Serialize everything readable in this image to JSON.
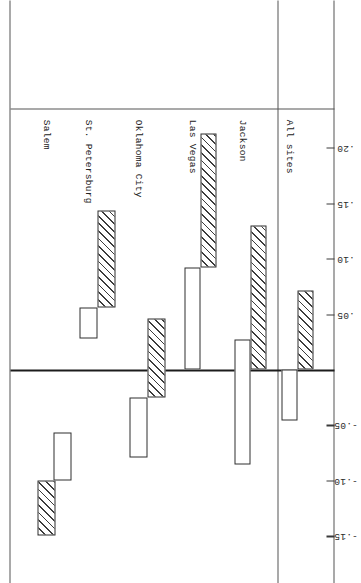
{
  "chart_data": {
    "type": "bar",
    "title": "",
    "subtitle": "",
    "xlabel": "",
    "ylabel": "",
    "orientation": "rotated-90",
    "grid": false,
    "legend_position": "none",
    "categories": [
      "All sites",
      "Jackson",
      "Las Vegas",
      "Oklahoma City",
      "St. Petersburg",
      "Salem"
    ],
    "value_axis": {
      "ticks": [
        0.2,
        0.15,
        0.1,
        0.05,
        0.0,
        -0.05,
        -0.1,
        -0.15
      ],
      "tick_labels": [
        ".20",
        ".15",
        ".10",
        ".05",
        "0",
        "-.05",
        "-.10",
        "-.15"
      ],
      "ylim": [
        -0.18,
        0.23
      ],
      "zero_reference": 0.0
    },
    "series": [
      {
        "name": "hatched",
        "style": "hatched",
        "bars": [
          {
            "category": "All sites",
            "start": 0.0,
            "end": 0.071
          },
          {
            "category": "Jackson",
            "start": 0.0,
            "end": 0.13
          },
          {
            "category": "Las Vegas",
            "start": 0.092,
            "end": 0.213
          },
          {
            "category": "Oklahoma City",
            "start": -0.025,
            "end": 0.046
          },
          {
            "category": "St. Petersburg",
            "start": 0.056,
            "end": 0.143
          },
          {
            "category": "Salem",
            "start": -0.15,
            "end": -0.1
          }
        ]
      },
      {
        "name": "open",
        "style": "open",
        "bars": [
          {
            "category": "All sites",
            "start": -0.046,
            "end": 0.0
          },
          {
            "category": "Jackson",
            "start": -0.086,
            "end": 0.027
          },
          {
            "category": "Las Vegas",
            "start": 0.0,
            "end": 0.092
          },
          {
            "category": "Oklahoma City",
            "start": -0.079,
            "end": -0.025
          },
          {
            "category": "St. Petersburg",
            "start": 0.028,
            "end": 0.056
          },
          {
            "category": "Salem",
            "start": -0.1,
            "end": -0.057
          }
        ]
      }
    ]
  },
  "axis": {
    "labels": [
      {
        "text": ".20",
        "value": 0.2
      },
      {
        "text": ".15",
        "value": 0.15
      },
      {
        "text": ".10",
        "value": 0.1
      },
      {
        "text": ".05",
        "value": 0.05
      },
      {
        "text": "-.05",
        "value": -0.05
      },
      {
        "text": "-.10",
        "value": -0.1
      },
      {
        "text": "-.15",
        "value": -0.15
      }
    ]
  },
  "categories": [
    {
      "label": "All sites"
    },
    {
      "label": "Jackson"
    },
    {
      "label": "Las Vegas"
    },
    {
      "label": "Oklahoma City"
    },
    {
      "label": "St. Petersburg"
    },
    {
      "label": "Salem"
    }
  ],
  "colors": {
    "ink": "#2e2e2e",
    "rule": "#555555",
    "hatch": "#3c3c3c",
    "paper": "#ffffff"
  }
}
